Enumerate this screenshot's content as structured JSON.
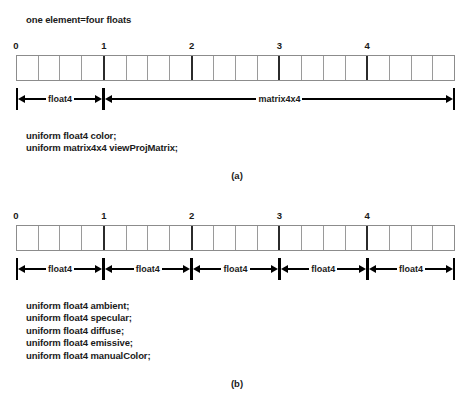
{
  "figure_a": {
    "note": "one element=four floats",
    "ticks": [
      "0",
      "1",
      "2",
      "3",
      "4"
    ],
    "cell_count": 20,
    "group_size": 4,
    "spans": [
      {
        "label": "float4",
        "start": 0,
        "end": 4
      },
      {
        "label": "matrix4x4",
        "start": 4,
        "end": 20
      }
    ],
    "code": [
      "uniform float4 color;",
      "uniform matrix4x4 viewProjMatrix;"
    ],
    "caption": "(a)"
  },
  "figure_b": {
    "ticks": [
      "0",
      "1",
      "2",
      "3",
      "4"
    ],
    "cell_count": 20,
    "group_size": 4,
    "spans": [
      {
        "label": "float4",
        "start": 0,
        "end": 4
      },
      {
        "label": "float4",
        "start": 4,
        "end": 8
      },
      {
        "label": "float4",
        "start": 8,
        "end": 12
      },
      {
        "label": "float4",
        "start": 12,
        "end": 16
      },
      {
        "label": "float4",
        "start": 16,
        "end": 20
      }
    ],
    "code": [
      "uniform float4 ambient;",
      "uniform float4 specular;",
      "uniform float4 diffuse;",
      "uniform float4 emissive;",
      "uniform float4 manualColor;"
    ],
    "caption": "(b)"
  }
}
